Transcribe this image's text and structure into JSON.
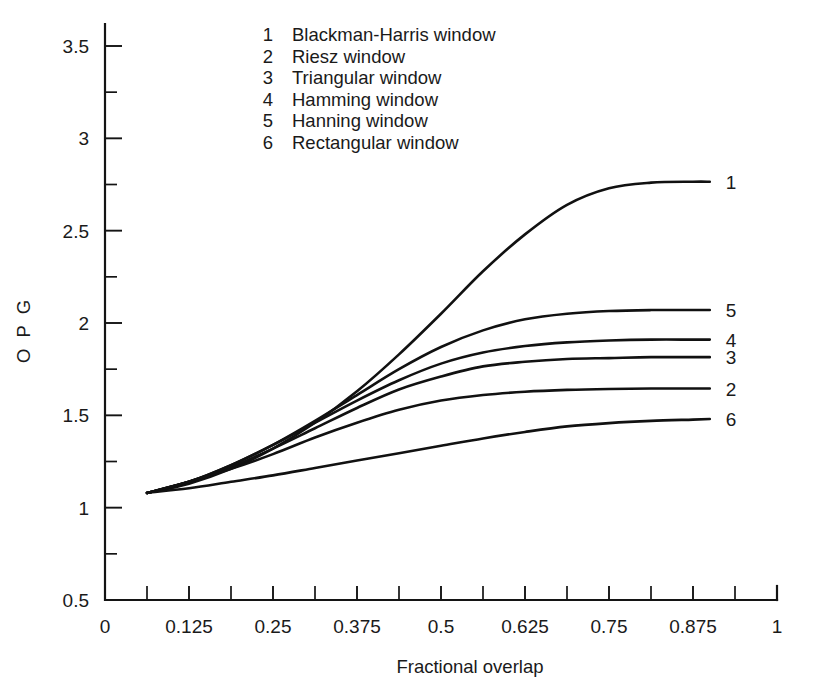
{
  "chart_data": {
    "type": "line",
    "title": "",
    "xlabel": "Fractional overlap",
    "ylabel": "O P G",
    "xlim": [
      0,
      1
    ],
    "ylim": [
      0.5,
      3.75
    ],
    "grid": false,
    "legend_position": "top-center-inside",
    "xticks": [
      0,
      0.125,
      0.25,
      0.375,
      0.5,
      0.625,
      0.75,
      0.875,
      1
    ],
    "xticklabels": [
      "0",
      "0.125",
      "0.25",
      "0.375",
      "0.5",
      "0.625",
      "0.75",
      "0.875",
      "1"
    ],
    "xminor_step": 0.0625,
    "yticks": [
      0.5,
      1,
      1.5,
      2,
      2.5,
      3,
      3.5
    ],
    "yticklabels": [
      "0.5",
      "1",
      "1.5",
      "2",
      "2.5",
      "3",
      "3.5"
    ],
    "yminor_step": 0.25,
    "series": [
      {
        "id": "1",
        "name": "Blackman-Harris window",
        "end_label": "1",
        "x": [
          0.0625,
          0.125,
          0.1875,
          0.25,
          0.3125,
          0.375,
          0.4375,
          0.5,
          0.5625,
          0.625,
          0.6875,
          0.75,
          0.8125,
          0.875,
          0.9
        ],
        "y": [
          1.08,
          1.13,
          1.21,
          1.32,
          1.46,
          1.63,
          1.83,
          2.05,
          2.28,
          2.48,
          2.64,
          2.73,
          2.76,
          2.765,
          2.765
        ]
      },
      {
        "id": "5",
        "name": "Hanning window",
        "end_label": "5",
        "x": [
          0.0625,
          0.125,
          0.1875,
          0.25,
          0.3125,
          0.375,
          0.4375,
          0.5,
          0.5625,
          0.625,
          0.6875,
          0.75,
          0.8125,
          0.875,
          0.9
        ],
        "y": [
          1.08,
          1.14,
          1.23,
          1.34,
          1.47,
          1.61,
          1.75,
          1.87,
          1.96,
          2.02,
          2.05,
          2.065,
          2.07,
          2.07,
          2.07
        ]
      },
      {
        "id": "4",
        "name": "Hamming window",
        "end_label": "4",
        "x": [
          0.0625,
          0.125,
          0.1875,
          0.25,
          0.3125,
          0.375,
          0.4375,
          0.5,
          0.5625,
          0.625,
          0.6875,
          0.75,
          0.8125,
          0.875,
          0.9
        ],
        "y": [
          1.08,
          1.14,
          1.23,
          1.34,
          1.46,
          1.58,
          1.69,
          1.78,
          1.84,
          1.875,
          1.895,
          1.905,
          1.91,
          1.91,
          1.91
        ]
      },
      {
        "id": "3",
        "name": "Triangular window",
        "end_label": "3",
        "x": [
          0.0625,
          0.125,
          0.1875,
          0.25,
          0.3125,
          0.375,
          0.4375,
          0.5,
          0.5625,
          0.625,
          0.6875,
          0.75,
          0.8125,
          0.875,
          0.9
        ],
        "y": [
          1.08,
          1.14,
          1.22,
          1.32,
          1.43,
          1.54,
          1.64,
          1.71,
          1.765,
          1.79,
          1.805,
          1.81,
          1.815,
          1.815,
          1.815
        ]
      },
      {
        "id": "2",
        "name": "Riesz window",
        "end_label": "2",
        "x": [
          0.0625,
          0.125,
          0.1875,
          0.25,
          0.3125,
          0.375,
          0.4375,
          0.5,
          0.5625,
          0.625,
          0.6875,
          0.75,
          0.8125,
          0.875,
          0.9
        ],
        "y": [
          1.08,
          1.14,
          1.21,
          1.29,
          1.38,
          1.46,
          1.53,
          1.58,
          1.61,
          1.628,
          1.638,
          1.643,
          1.645,
          1.645,
          1.645
        ]
      },
      {
        "id": "6",
        "name": "Rectangular window",
        "end_label": "6",
        "x": [
          0.0625,
          0.125,
          0.1875,
          0.25,
          0.3125,
          0.375,
          0.4375,
          0.5,
          0.5625,
          0.625,
          0.6875,
          0.75,
          0.8125,
          0.875,
          0.9
        ],
        "y": [
          1.08,
          1.105,
          1.14,
          1.175,
          1.215,
          1.255,
          1.295,
          1.335,
          1.375,
          1.41,
          1.44,
          1.458,
          1.47,
          1.477,
          1.48
        ]
      }
    ]
  },
  "legend": {
    "entries": [
      {
        "num": "1",
        "label": "Blackman-Harris window"
      },
      {
        "num": "2",
        "label": "Riesz window"
      },
      {
        "num": "3",
        "label": "Triangular window"
      },
      {
        "num": "4",
        "label": "Hamming window"
      },
      {
        "num": "5",
        "label": "Hanning window"
      },
      {
        "num": "6",
        "label": "Rectangular window"
      }
    ]
  },
  "colors": {
    "curve": "#111111",
    "axis": "#141414",
    "text": "#1a1a1a",
    "background": "#ffffff"
  }
}
